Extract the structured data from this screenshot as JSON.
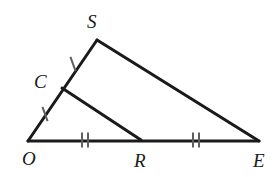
{
  "figure": {
    "background_color": "#ffffff",
    "stroke_color": "#1a1a1a",
    "tick_color": "#5f5f5f",
    "label_color": "#1a1a1a",
    "width": 276,
    "height": 177
  },
  "points": {
    "O": {
      "label": "O",
      "x": 28,
      "y": 141,
      "label_x": 22,
      "label_y": 165
    },
    "S": {
      "label": "S",
      "x": 97,
      "y": 40,
      "label_x": 87,
      "label_y": 28
    },
    "E": {
      "label": "E",
      "x": 259,
      "y": 141,
      "label_x": 253,
      "label_y": 167
    },
    "C": {
      "label": "C",
      "x": 62,
      "y": 88,
      "label_x": 34,
      "label_y": 88
    },
    "R": {
      "label": "R",
      "x": 141,
      "y": 140,
      "label_x": 134,
      "label_y": 167
    }
  },
  "segments": [
    {
      "name": "O-S",
      "from": "O",
      "to": "S",
      "x1": 28,
      "y1": 141,
      "x2": 97,
      "y2": 40,
      "width": 3
    },
    {
      "name": "S-E",
      "from": "S",
      "to": "E",
      "x1": 97,
      "y1": 40,
      "x2": 259,
      "y2": 141,
      "width": 3
    },
    {
      "name": "O-E",
      "from": "O",
      "to": "E",
      "x1": 28,
      "y1": 141,
      "x2": 259,
      "y2": 141,
      "width": 3
    },
    {
      "name": "C-R",
      "from": "C",
      "to": "R",
      "x1": 62,
      "y1": 88,
      "x2": 141,
      "y2": 140,
      "width": 3
    }
  ],
  "tick_marks": [
    {
      "name": "tick-segment-CS",
      "on_segment": "C-S",
      "count": 1,
      "cx": 73,
      "cy": 64,
      "angle_deg": 20,
      "length": 15,
      "spacing": 0
    },
    {
      "name": "tick-segment-OC",
      "on_segment": "O-C",
      "count": 1,
      "cx": 45,
      "cy": 114,
      "angle_deg": 20,
      "length": 15,
      "spacing": 0
    },
    {
      "name": "tick-segment-OR",
      "on_segment": "O-R",
      "count": 2,
      "cx": 85,
      "cy": 140,
      "angle_deg": 0,
      "length": 15,
      "spacing": 6
    },
    {
      "name": "tick-segment-RE",
      "on_segment": "R-E",
      "count": 2,
      "cx": 196,
      "cy": 140,
      "angle_deg": 0,
      "length": 15,
      "spacing": 6
    }
  ],
  "label_font_size": 19
}
